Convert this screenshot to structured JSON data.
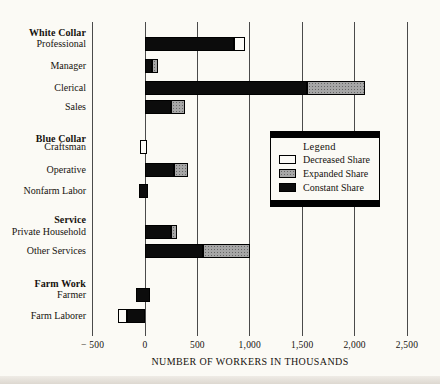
{
  "chart_data": {
    "type": "bar",
    "orientation": "horizontal",
    "xlabel": "NUMBER OF WORKERS IN THOUSANDS",
    "xlim": [
      -500,
      2500
    ],
    "grid": true,
    "units": "thousands of workers",
    "xticks": [
      {
        "value": -500,
        "label": "− 500"
      },
      {
        "value": 0,
        "label": "0"
      },
      {
        "value": 500,
        "label": "500"
      },
      {
        "value": 1000,
        "label": "1,000"
      },
      {
        "value": 1500,
        "label": "1,500"
      },
      {
        "value": 2000,
        "label": "2,000"
      },
      {
        "value": 2500,
        "label": "2,500"
      }
    ],
    "share_colors": {
      "decreased": "#fcfbf7",
      "expanded": "#a6a6a6",
      "constant": "#0c0c0c"
    },
    "groups": [
      {
        "header": "White Collar",
        "rows": [
          {
            "label": "Professional",
            "segments": [
              {
                "share": "constant",
                "from": 0,
                "to": 850
              },
              {
                "share": "decreased",
                "from": 850,
                "to": 950
              }
            ]
          },
          {
            "label": "Manager",
            "segments": [
              {
                "share": "constant",
                "from": 0,
                "to": 70
              },
              {
                "share": "expanded",
                "from": 70,
                "to": 125
              }
            ]
          },
          {
            "label": "Clerical",
            "segments": [
              {
                "share": "constant",
                "from": 0,
                "to": 1550
              },
              {
                "share": "expanded",
                "from": 1550,
                "to": 2100
              }
            ]
          },
          {
            "label": "Sales",
            "segments": [
              {
                "share": "constant",
                "from": 0,
                "to": 250
              },
              {
                "share": "expanded",
                "from": 250,
                "to": 380
              }
            ]
          }
        ]
      },
      {
        "header": "Blue Collar",
        "rows": [
          {
            "label": "Craftsman",
            "segments": [
              {
                "share": "decreased",
                "from": -50,
                "to": 20
              }
            ]
          },
          {
            "label": "Operative",
            "segments": [
              {
                "share": "constant",
                "from": 0,
                "to": 275
              },
              {
                "share": "expanded",
                "from": 275,
                "to": 415
              }
            ]
          },
          {
            "label": "Nonfarm Labor",
            "segments": [
              {
                "share": "constant",
                "from": -60,
                "to": 25
              }
            ]
          }
        ]
      },
      {
        "header": "Service",
        "rows": [
          {
            "label": "Private Household",
            "segments": [
              {
                "share": "constant",
                "from": 0,
                "to": 250
              },
              {
                "share": "expanded",
                "from": 250,
                "to": 305
              }
            ]
          },
          {
            "label": "Other Services",
            "segments": [
              {
                "share": "constant",
                "from": 0,
                "to": 550
              },
              {
                "share": "expanded",
                "from": 550,
                "to": 1000
              }
            ]
          }
        ]
      },
      {
        "header": "Farm Work",
        "rows": [
          {
            "label": "Farmer",
            "segments": [
              {
                "share": "constant",
                "from": -90,
                "to": 50
              }
            ]
          },
          {
            "label": "Farm Laborer",
            "segments": [
              {
                "share": "decreased",
                "from": -260,
                "to": -175
              },
              {
                "share": "constant",
                "from": -175,
                "to": 0
              }
            ]
          }
        ]
      }
    ],
    "legend": {
      "title": "Legend",
      "position": "inside-right",
      "items": [
        {
          "label": "Decreased Share",
          "share": "decreased"
        },
        {
          "label": "Expanded Share",
          "share": "expanded"
        },
        {
          "label": "Constant Share",
          "share": "constant"
        }
      ]
    }
  }
}
